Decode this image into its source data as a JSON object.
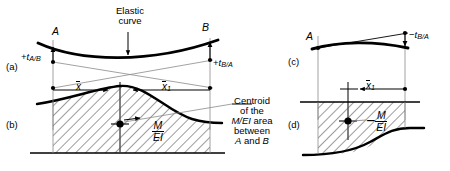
{
  "figure": {
    "background_color": "#ffffff",
    "line_color": "#000000",
    "thin_line_color": "#6f6f6f",
    "hatch_color": "#4a4a4a"
  },
  "panels": {
    "a": {
      "label": "(a)"
    },
    "b": {
      "label": "(b)"
    },
    "c": {
      "label": "(c)"
    },
    "d": {
      "label": "(d)"
    }
  },
  "points": {
    "a_left": "A",
    "b_right": "B"
  },
  "annotations": {
    "elastic_curve_line1": "Elastic",
    "elastic_curve_line2": "curve",
    "centroid_line1": "Centroid",
    "centroid_line2": "of the",
    "centroid_line3_pre": "M/EI",
    "centroid_line3_post": " area",
    "centroid_line4": "between",
    "centroid_line5_a": "A",
    "centroid_line5_and": " and ",
    "centroid_line5_b": "B"
  },
  "deviations": {
    "t_ab": {
      "sign": "+",
      "symbol": "t",
      "subscript": "A/B"
    },
    "t_ba_left": {
      "sign": "+",
      "symbol": "t",
      "subscript": "B/A"
    },
    "t_ba_right": {
      "sign": "−",
      "symbol": "t",
      "subscript": "B/A"
    }
  },
  "dimensions": {
    "x_bar": {
      "symbol": "x",
      "subscript": ""
    },
    "x_bar_1": {
      "symbol": "x",
      "subscript": "1"
    },
    "x_bar_1_right": {
      "symbol": "x",
      "subscript": "1"
    }
  },
  "diagram_quantities": {
    "m_ei_left": {
      "sign": "",
      "numerator": "M",
      "denominator": "EI"
    },
    "m_ei_right": {
      "sign": "−",
      "numerator": "M",
      "denominator": "EI"
    }
  }
}
